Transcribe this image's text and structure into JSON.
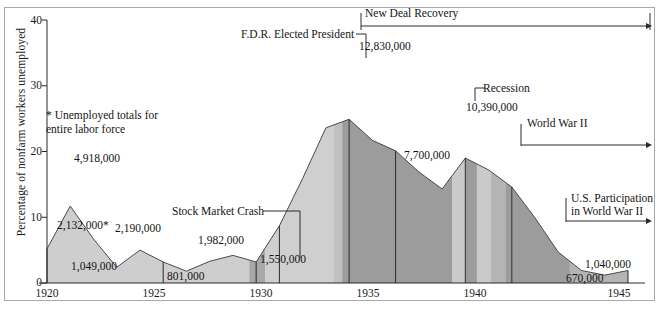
{
  "figure": {
    "ylabel": "Percentage of nonfarm workers unemployed",
    "note": "* Unemployed totals for\nentire labor force",
    "frame_color": "#a8a8a8"
  },
  "chart_data": {
    "type": "area",
    "title": "",
    "xlabel": "",
    "ylabel": "Percentage of nonfarm workers unemployed",
    "xlim": [
      1920,
      1945
    ],
    "ylim": [
      0,
      40
    ],
    "yticks": [
      0,
      10,
      20,
      30,
      40
    ],
    "xticks": [
      1920,
      1925,
      1930,
      1935,
      1940,
      1945
    ],
    "grid": false,
    "legend": "none",
    "x": [
      1920,
      1921,
      1922,
      1923,
      1924,
      1925,
      1926,
      1927,
      1928,
      1929,
      1930,
      1931,
      1932,
      1933,
      1934,
      1935,
      1936,
      1937,
      1938,
      1939,
      1940,
      1941,
      1942,
      1943,
      1944,
      1945
    ],
    "values": [
      5.2,
      11.7,
      6.7,
      2.4,
      5.0,
      3.2,
      1.8,
      3.3,
      4.2,
      3.2,
      8.7,
      15.9,
      23.6,
      24.9,
      21.7,
      20.1,
      16.9,
      14.3,
      19.0,
      17.2,
      14.6,
      9.9,
      4.7,
      1.9,
      1.2,
      1.9
    ],
    "value_labels": [
      {
        "label": "2,132,000*",
        "year": 1920,
        "x": 57,
        "y": 219
      },
      {
        "label": "4,918,000",
        "year": 1921,
        "x": 74,
        "y": 152
      },
      {
        "label": "1,049,000",
        "year": 1923,
        "x": 71,
        "y": 260
      },
      {
        "label": "2,190,000",
        "year": 1924,
        "x": 115,
        "y": 222
      },
      {
        "label": "801,000",
        "year": 1926,
        "x": 167,
        "y": 270
      },
      {
        "label": "1,982,000",
        "year": 1928,
        "x": 198,
        "y": 234
      },
      {
        "label": "1,550,000",
        "year": 1929,
        "x": 260,
        "y": 253
      },
      {
        "label": "12,830,000",
        "year": 1933,
        "x": 359,
        "y": 40
      },
      {
        "label": "7,700,000",
        "year": 1937,
        "x": 404,
        "y": 149
      },
      {
        "label": "10,390,000",
        "year": 1938,
        "x": 466,
        "y": 101
      },
      {
        "label": "670,000",
        "year": 1944,
        "x": 566,
        "y": 272
      },
      {
        "label": "1,040,000",
        "year": 1945,
        "x": 585,
        "y": 258
      }
    ],
    "annotations": [
      {
        "text": "F.D.R. Elected President",
        "kind": "leader-label",
        "x": 241,
        "y": 28
      },
      {
        "text": "New Deal Recovery",
        "kind": "span-arrow",
        "x": 365,
        "y": 7
      },
      {
        "text": "Recession",
        "kind": "leader-label",
        "x": 483,
        "y": 82
      },
      {
        "text": "World War II",
        "kind": "span-arrow",
        "x": 527,
        "y": 117
      },
      {
        "text": "U.S. Participation\nin World War II",
        "kind": "span-arrow",
        "x": 571,
        "y": 192
      },
      {
        "text": "Stock Market Crash",
        "kind": "leader-label",
        "x": 172,
        "y": 205
      }
    ],
    "shading_bands": [
      {
        "from": 1920,
        "to": 1928.7,
        "color": "#cecece"
      },
      {
        "from": 1928.7,
        "to": 1929.4,
        "color": "#a8a8a8"
      },
      {
        "from": 1929.4,
        "to": 1932.35,
        "color": "#cfcfcf"
      },
      {
        "from": 1932.35,
        "to": 1932.7,
        "color": "#c0c0c0"
      },
      {
        "from": 1932.7,
        "to": 1937.45,
        "color": "#9c9c9c"
      },
      {
        "from": 1937.45,
        "to": 1938.0,
        "color": "#cacaca"
      },
      {
        "from": 1938.0,
        "to": 1938.5,
        "color": "#9c9c9c"
      },
      {
        "from": 1938.5,
        "to": 1939.1,
        "color": "#cacaca"
      },
      {
        "from": 1939.1,
        "to": 1939.75,
        "color": "#b4b4b4"
      },
      {
        "from": 1939.75,
        "to": 1940.0,
        "color": "#9c9c9c"
      },
      {
        "from": 1940.0,
        "to": 1942.5,
        "color": "#9c9c9c"
      },
      {
        "from": 1942.5,
        "to": 1945,
        "color": "#b4b4b4"
      }
    ],
    "year_markers": [
      1920,
      1925,
      1929,
      1930,
      1933,
      1935,
      1938,
      1940,
      1945
    ]
  },
  "axis": {
    "ytick_labels": [
      "40",
      "30",
      "20",
      "10",
      "0"
    ],
    "xtick_labels": [
      "1920",
      "1925",
      "1930",
      "1935",
      "1940",
      "1945"
    ]
  }
}
